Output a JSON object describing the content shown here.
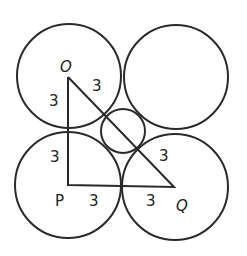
{
  "diagram": {
    "stroke_color": "#2a2a2a",
    "background": "#ffffff",
    "circles": [
      {
        "name": "circle-top-left",
        "cx": 69,
        "cy": 76,
        "r": 52
      },
      {
        "name": "circle-top-right",
        "cx": 176,
        "cy": 77,
        "r": 52
      },
      {
        "name": "circle-bottom-left",
        "cx": 68,
        "cy": 185,
        "r": 53
      },
      {
        "name": "circle-bottom-right",
        "cx": 175,
        "cy": 187,
        "r": 53
      },
      {
        "name": "circle-center-small",
        "cx": 123,
        "cy": 131,
        "r": 22
      }
    ],
    "triangle": {
      "vertices": {
        "O": [
          68,
          77
        ],
        "P": [
          68,
          185
        ],
        "Q": [
          174,
          187
        ]
      }
    },
    "labels": {
      "O": "O",
      "P": "P",
      "Q": "Q",
      "op_upper": "3",
      "op_lower": "3",
      "oq_upper": "3",
      "oq_lower": "3",
      "pq_left": "3",
      "pq_right": "3"
    }
  }
}
